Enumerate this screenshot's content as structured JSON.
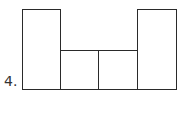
{
  "problem": {
    "number_label": "4."
  },
  "figure": {
    "stroke_color": "#2a2a2a",
    "fill_color": "#ffffff",
    "shapes": [
      {
        "name": "left-tall-rectangle",
        "x": 22,
        "y": 9,
        "w": 39,
        "h": 81
      },
      {
        "name": "middle-left-square",
        "x": 60,
        "y": 50,
        "w": 39,
        "h": 40
      },
      {
        "name": "middle-right-square",
        "x": 98,
        "y": 50,
        "w": 40,
        "h": 40
      },
      {
        "name": "right-tall-rectangle",
        "x": 137,
        "y": 9,
        "w": 40,
        "h": 81
      }
    ]
  }
}
